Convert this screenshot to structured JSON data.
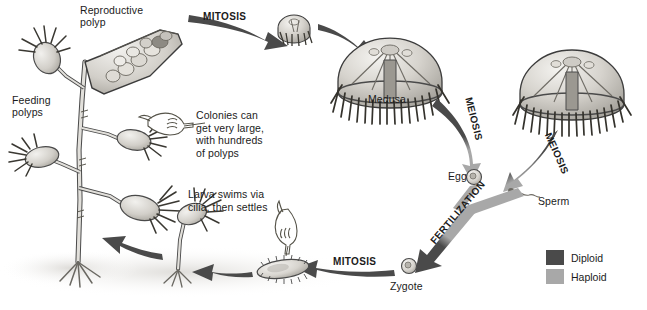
{
  "figure": {
    "background_color": "#ffffff"
  },
  "colors": {
    "diploid": "#4a4a4a",
    "haploid": "#a8a8a8",
    "outline": "#3c3c3c",
    "text": "#1b1b1b",
    "tissue_light": "#e9e7e2",
    "tissue_mid": "#c8c5bd",
    "tissue_dark": "#8f8c85",
    "shadow": "#d8d6d2"
  },
  "labels": {
    "reproductive_polyp": "Reproductive\npolyp",
    "feeding_polyps": "Feeding\npolyps",
    "medusa": "Medusa",
    "egg": "Egg",
    "sperm": "Sperm",
    "zygote": "Zygote"
  },
  "processes": {
    "mitosis_top": "MITOSIS",
    "mitosis_bottom": "MITOSIS",
    "meiosis_left": "MEIOSIS",
    "meiosis_right": "MEIOSIS",
    "fertilization": "FERTILIZATION"
  },
  "notes": {
    "colony_note": "Colonies can\nget very large,\nwith hundreds\nof polyps",
    "larva_note": "Larva swims via\ncilia, then settles"
  },
  "legend": {
    "items": [
      {
        "label": "Diploid",
        "color": "#4a4a4a"
      },
      {
        "label": "Haploid",
        "color": "#a8a8a8"
      }
    ]
  },
  "icons": {
    "pointing_hand_right": "pointing-hand-right-icon",
    "pointing_hand_down": "pointing-hand-down-icon"
  }
}
